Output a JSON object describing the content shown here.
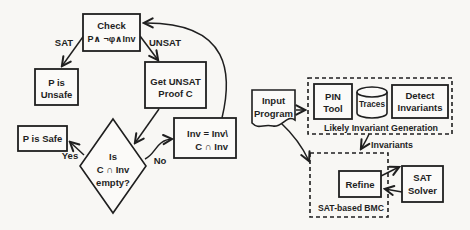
{
  "colors": {
    "ink": "#1f1f1f",
    "background": "#f8f7f4",
    "box_fill": "#fbfaf8"
  },
  "left_flowchart": {
    "check_box": {
      "line1": "Check",
      "line2": "P∧ ¬φ∧Inv"
    },
    "sat_label": "SAT",
    "unsat_label": "UNSAT",
    "p_unsafe_box": {
      "line1": "P is",
      "line2": "Unsafe"
    },
    "get_unsat_box": {
      "line1": "Get UNSAT",
      "line2": "Proof C"
    },
    "p_safe_box": {
      "label": "P is Safe"
    },
    "yes_label": "Yes",
    "no_label": "No",
    "decision_diamond": {
      "line1": "Is",
      "line2": "C ∩ Inv",
      "line3": "empty?"
    },
    "inv_update_box": {
      "line1": "Inv = Inv\\",
      "line2": "C ∩ Inv"
    }
  },
  "right_diagram": {
    "input_program": {
      "line1": "Input",
      "line2": "Program"
    },
    "likely_invariant_generation": {
      "label": "Likely Invariant Generation",
      "pin_tool_box": {
        "line1": "PIN",
        "line2": "Tool"
      },
      "traces_cylinder": {
        "label": "Traces"
      },
      "detect_invariants_box": {
        "line1": "Detect",
        "line2": "Invariants"
      }
    },
    "invariants_label": "Invariants",
    "sat_based_bmc": {
      "label": "SAT-based BMC",
      "refine_box": {
        "label": "Refine"
      },
      "sat_solver_box": {
        "line1": "SAT",
        "line2": "Solver"
      }
    }
  }
}
